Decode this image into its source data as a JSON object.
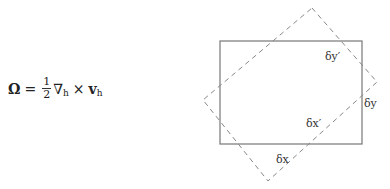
{
  "equation": {
    "lhs": "Ω",
    "equals": "=",
    "frac_num": "1",
    "frac_den": "2",
    "nabla": "∇",
    "nabla_sub": "h",
    "times": "×",
    "v": "v",
    "v_sub": "h"
  },
  "diagram": {
    "labels": {
      "dy_prime": "δy′",
      "dy": "δy",
      "dx_prime": "δx′",
      "dx": "δx"
    },
    "solid_rect_color": "#777777",
    "dashed_rect_color": "#888888"
  }
}
